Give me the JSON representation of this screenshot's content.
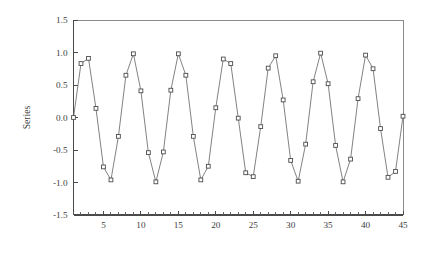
{
  "chart_data": {
    "type": "line",
    "title": "",
    "subtitle": "",
    "xlabel": "",
    "ylabel": "Series",
    "xlim": [
      1,
      45
    ],
    "ylim": [
      -1.5,
      1.5
    ],
    "grid": false,
    "legend": null,
    "marker": "open-square",
    "line_color": "#6b6b6b",
    "marker_face_color": "#ffffff",
    "marker_edge_color": "#4c4c4c",
    "x_ticks_major": [
      5,
      10,
      15,
      20,
      25,
      30,
      35,
      40,
      45
    ],
    "x_tick_labels": [
      "5",
      "10",
      "15",
      "20",
      "25",
      "30",
      "35",
      "40",
      "45"
    ],
    "x_ticks_minor_step": 1,
    "y_ticks": [
      -1.5,
      -1.0,
      -0.5,
      0.0,
      0.5,
      1.0,
      1.5
    ],
    "y_tick_labels": [
      "-1.5",
      "-1.0",
      "-0.5",
      "0.0",
      "0.5",
      "1.0",
      "1.5"
    ],
    "x": [
      1,
      2,
      3,
      4,
      5,
      6,
      7,
      8,
      9,
      10,
      11,
      12,
      13,
      14,
      15,
      16,
      17,
      18,
      19,
      20,
      21,
      22,
      23,
      24,
      25,
      26,
      27,
      28,
      29,
      30,
      31,
      32,
      33,
      34,
      35,
      36,
      37,
      38,
      39,
      40,
      41,
      42,
      43,
      44,
      45
    ],
    "series": [
      {
        "name": "Series",
        "values": [
          0.0,
          0.83,
          0.91,
          0.14,
          -0.76,
          -0.96,
          -0.29,
          0.65,
          0.98,
          0.41,
          -0.54,
          -0.99,
          -0.53,
          0.42,
          0.98,
          0.65,
          -0.29,
          -0.96,
          -0.75,
          0.15,
          0.9,
          0.83,
          -0.01,
          -0.85,
          -0.91,
          -0.14,
          0.76,
          0.95,
          0.27,
          -0.66,
          -0.98,
          -0.41,
          0.55,
          0.99,
          0.52,
          -0.43,
          -0.99,
          -0.64,
          0.29,
          0.96,
          0.75,
          -0.17,
          -0.92,
          -0.83,
          0.02
        ]
      }
    ]
  },
  "plot": {
    "left": 73.5,
    "right": 403.0,
    "top": 20.0,
    "bottom": 215.0
  }
}
